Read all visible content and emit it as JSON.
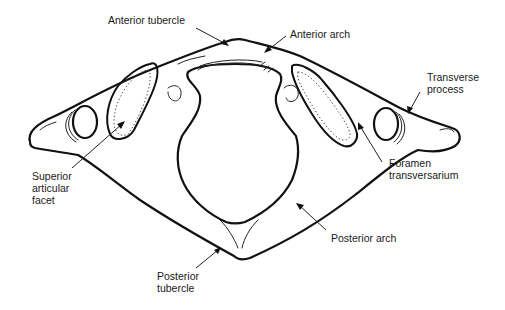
{
  "figure": {
    "labels": {
      "anterior_tubercle": "Anterior tubercle",
      "anterior_arch": "Anterior arch",
      "transverse_process": "Transverse\nprocess",
      "superior_articular_facet": "Superior\narticular\nfacet",
      "foramen_transversarium": "Foramen\ntransversarium",
      "posterior_arch": "Posterior arch",
      "posterior_tubercle": "Posterior\ntubercle"
    }
  }
}
